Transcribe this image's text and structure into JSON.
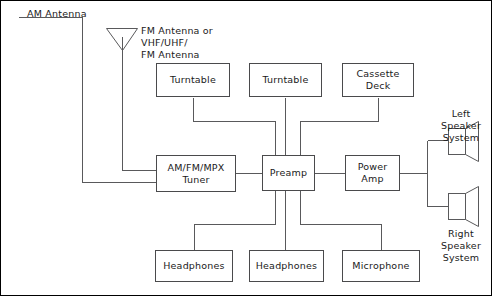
{
  "diagram": {
    "canvas": {
      "width": 492,
      "height": 296
    },
    "colors": {
      "line": "#59595b",
      "box_border": "#4a4a4c",
      "frame": "#000000",
      "background": "#ffffff",
      "text": "#1a1a1a"
    },
    "labels": {
      "am_antenna": "AM Antenna",
      "fm_antenna": "FM Antenna or\nVHF/UHF/\nFM Antenna",
      "left_speaker": "Left\nSpeaker\nSystem",
      "right_speaker": "Right\nSpeaker\nSystem"
    },
    "boxes": [
      {
        "id": "turntable-1",
        "label": "Turntable",
        "x": 156,
        "y": 63,
        "w": 74,
        "h": 34
      },
      {
        "id": "turntable-2",
        "label": "Turntable",
        "x": 249,
        "y": 63,
        "w": 73,
        "h": 34
      },
      {
        "id": "cassette-deck",
        "label": "Cassette\nDeck",
        "x": 342,
        "y": 63,
        "w": 72,
        "h": 34
      },
      {
        "id": "tuner",
        "label": "AM/FM/MPX\nTuner",
        "x": 156,
        "y": 155,
        "w": 80,
        "h": 37
      },
      {
        "id": "preamp",
        "label": "Preamp",
        "x": 262,
        "y": 155,
        "w": 53,
        "h": 36
      },
      {
        "id": "power-amp",
        "label": "Power\nAmp",
        "x": 345,
        "y": 155,
        "w": 55,
        "h": 36
      },
      {
        "id": "headphones-1",
        "label": "Headphones",
        "x": 155,
        "y": 250,
        "w": 78,
        "h": 32
      },
      {
        "id": "headphones-2",
        "label": "Headphones",
        "x": 249,
        "y": 250,
        "w": 75,
        "h": 32
      },
      {
        "id": "microphone",
        "label": "Microphone",
        "x": 342,
        "y": 250,
        "w": 78,
        "h": 32
      }
    ],
    "icons": {
      "am_antenna": "antenna-wire-icon",
      "fm_antenna": "dipole-antenna-icon",
      "left_speaker": "speaker-icon",
      "right_speaker": "speaker-icon"
    },
    "connections": [
      {
        "from": "am-antenna",
        "to": "tuner"
      },
      {
        "from": "fm-antenna",
        "to": "tuner"
      },
      {
        "from": "turntable-1",
        "to": "preamp"
      },
      {
        "from": "turntable-2",
        "to": "preamp"
      },
      {
        "from": "cassette-deck",
        "to": "preamp"
      },
      {
        "from": "tuner",
        "to": "preamp"
      },
      {
        "from": "preamp",
        "to": "power-amp"
      },
      {
        "from": "power-amp",
        "to": "left-speaker"
      },
      {
        "from": "power-amp",
        "to": "right-speaker"
      },
      {
        "from": "preamp",
        "to": "headphones-1"
      },
      {
        "from": "preamp",
        "to": "headphones-2"
      },
      {
        "from": "preamp",
        "to": "microphone"
      }
    ]
  }
}
